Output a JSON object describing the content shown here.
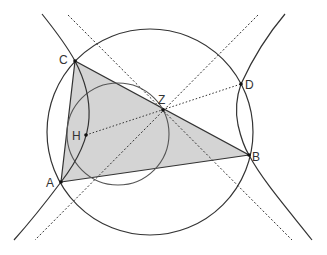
{
  "diagram": {
    "type": "geometry",
    "colors": {
      "stroke": "#333333",
      "fill_triangle": "#d4d4d4",
      "background": "#ffffff"
    },
    "points": [
      {
        "name": "C",
        "x": 75,
        "y": 61,
        "label_x": 59,
        "label_y": 64
      },
      {
        "name": "Z",
        "x": 163,
        "y": 110,
        "label_x": 158,
        "label_y": 104
      },
      {
        "name": "D",
        "x": 241,
        "y": 84,
        "label_x": 245,
        "label_y": 89
      },
      {
        "name": "H",
        "x": 86,
        "y": 135,
        "label_x": 72,
        "label_y": 140
      },
      {
        "name": "B",
        "x": 249,
        "y": 155,
        "label_x": 252,
        "label_y": 161
      },
      {
        "name": "A",
        "x": 61,
        "y": 182,
        "label_x": 46,
        "label_y": 187
      }
    ],
    "labels": {
      "C": "C",
      "Z": "Z",
      "D": "D",
      "H": "H",
      "B": "B",
      "A": "A"
    },
    "triangle": [
      "A",
      "B",
      "C"
    ],
    "circles": [
      {
        "name": "big-circle",
        "cx": 150,
        "cy": 132,
        "r": 103
      },
      {
        "name": "small-circle",
        "cx": 118,
        "cy": 134,
        "r": 51
      }
    ],
    "asymptotes": [
      {
        "x1": 68,
        "y1": 15,
        "x2": 292,
        "y2": 240
      },
      {
        "x1": 258,
        "y1": 15,
        "x2": 35,
        "y2": 240
      }
    ],
    "dotted_line": {
      "from": "H",
      "to": "D"
    }
  }
}
